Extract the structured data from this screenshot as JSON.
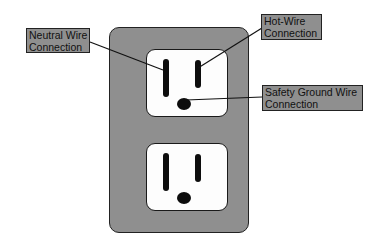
{
  "diagram": {
    "colors": {
      "plate": "#8f8f8f",
      "receptacle_face": "#fdfdfd",
      "slots": "#0d0d0d",
      "label_fill": "#8f8f8f",
      "outline": "#222222"
    },
    "labels": {
      "neutral": {
        "line1": "Neutral Wire",
        "line2": "Connection"
      },
      "hot": {
        "line1": "Hot-Wire",
        "line2": "Connection"
      },
      "ground": {
        "line1": "Safety Ground Wire",
        "line2": "Connection"
      }
    },
    "receptacles": [
      {
        "position": "top",
        "annotated": true
      },
      {
        "position": "bottom",
        "annotated": false
      }
    ]
  }
}
